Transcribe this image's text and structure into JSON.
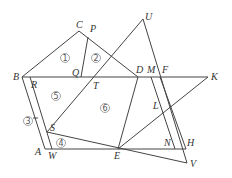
{
  "diagram": {
    "type": "geometry-figure",
    "points": {
      "C": {
        "x": 79,
        "y": 31
      },
      "P": {
        "x": 88,
        "y": 37
      },
      "U": {
        "x": 143,
        "y": 19
      },
      "B": {
        "x": 22,
        "y": 77
      },
      "R": {
        "x": 30,
        "y": 77
      },
      "Q": {
        "x": 81,
        "y": 77
      },
      "T": {
        "x": 94,
        "y": 77
      },
      "D": {
        "x": 138,
        "y": 77
      },
      "M": {
        "x": 151,
        "y": 77
      },
      "F": {
        "x": 160,
        "y": 77
      },
      "K": {
        "x": 208,
        "y": 77
      },
      "L": {
        "x": 166,
        "y": 106
      },
      "S": {
        "x": 47,
        "y": 132
      },
      "A": {
        "x": 45,
        "y": 149
      },
      "W": {
        "x": 52,
        "y": 149
      },
      "E": {
        "x": 118,
        "y": 149
      },
      "N": {
        "x": 175,
        "y": 149
      },
      "H": {
        "x": 186,
        "y": 149
      },
      "V": {
        "x": 187,
        "y": 163
      }
    },
    "labels": [
      {
        "text": "C",
        "x": 76,
        "y": 28
      },
      {
        "text": "P",
        "x": 90,
        "y": 32
      },
      {
        "text": "U",
        "x": 145,
        "y": 20
      },
      {
        "text": "B",
        "x": 13,
        "y": 80
      },
      {
        "text": "R",
        "x": 31,
        "y": 88
      },
      {
        "text": "Q",
        "x": 72,
        "y": 76
      },
      {
        "text": "T",
        "x": 93,
        "y": 89
      },
      {
        "text": "D",
        "x": 136,
        "y": 73
      },
      {
        "text": "M",
        "x": 147,
        "y": 73
      },
      {
        "text": "F",
        "x": 162,
        "y": 73
      },
      {
        "text": "K",
        "x": 211,
        "y": 80
      },
      {
        "text": "L",
        "x": 153,
        "y": 109
      },
      {
        "text": "S",
        "x": 50,
        "y": 131
      },
      {
        "text": "A",
        "x": 35,
        "y": 155
      },
      {
        "text": "W",
        "x": 48,
        "y": 159
      },
      {
        "text": "E",
        "x": 114,
        "y": 159
      },
      {
        "text": "N",
        "x": 164,
        "y": 146
      },
      {
        "text": "H",
        "x": 187,
        "y": 146
      },
      {
        "text": "V",
        "x": 190,
        "y": 167
      }
    ],
    "regions": [
      {
        "text": "1",
        "x": 65,
        "y": 58
      },
      {
        "text": "2",
        "x": 96,
        "y": 58
      },
      {
        "text": "3",
        "x": 28,
        "y": 121
      },
      {
        "text": "4",
        "x": 61,
        "y": 143
      },
      {
        "text": "5",
        "x": 56,
        "y": 96
      },
      {
        "text": "6",
        "x": 105,
        "y": 108
      }
    ]
  }
}
